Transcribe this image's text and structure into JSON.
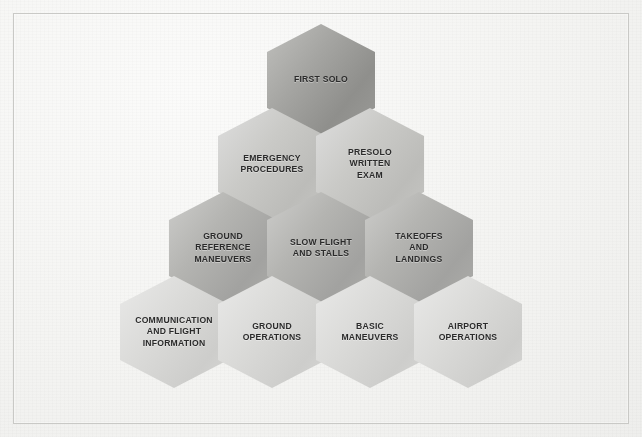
{
  "diagram": {
    "frame": {
      "visible": true,
      "color": "#c9c9c6"
    },
    "background_color": "#f4f4f2",
    "text_color": "#2b2b2b",
    "rows": [
      {
        "index": 1,
        "tone": "tone-1",
        "tone_color": "#9b9b98",
        "cells": [
          {
            "label": "FIRST SOLO",
            "x": 267,
            "y": 24
          }
        ]
      },
      {
        "index": 2,
        "tone": "tone-2",
        "tone_color": "#c6c6c3",
        "cells": [
          {
            "label": "EMERGENCY\nPROCEDURES",
            "x": 218,
            "y": 108
          },
          {
            "label": "PRESOLO\nWRITTEN\nEXAM",
            "x": 316,
            "y": 108
          }
        ]
      },
      {
        "index": 3,
        "tone": "tone-3",
        "tone_color": "#adadaa",
        "cells": [
          {
            "label": "GROUND\nREFERENCE\nMANEUVERS",
            "x": 169,
            "y": 192
          },
          {
            "label": "SLOW FLIGHT\nAND STALLS",
            "x": 267,
            "y": 192
          },
          {
            "label": "TAKEOFFS\nAND\nLANDINGS",
            "x": 365,
            "y": 192
          }
        ]
      },
      {
        "index": 4,
        "tone": "tone-4",
        "tone_color": "#d6d6d4",
        "cells": [
          {
            "label": "COMMUNICATION\nAND FLIGHT\nINFORMATION",
            "x": 120,
            "y": 276
          },
          {
            "label": "GROUND\nOPERATIONS",
            "x": 218,
            "y": 276
          },
          {
            "label": "BASIC\nMANEUVERS",
            "x": 316,
            "y": 276
          },
          {
            "label": "AIRPORT\nOPERATIONS",
            "x": 414,
            "y": 276
          }
        ]
      }
    ]
  }
}
